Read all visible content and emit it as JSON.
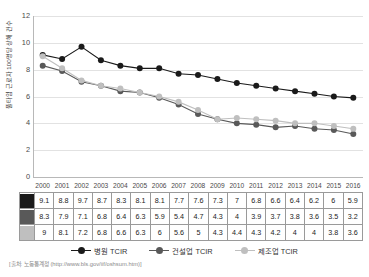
{
  "chart_data": {
    "type": "line",
    "title": "",
    "xlabel": "",
    "ylabel": "풀타임 근로자 100명당 상해 건수",
    "ylim": [
      0,
      12
    ],
    "yticks": [
      0,
      2,
      4,
      6,
      8,
      10,
      12
    ],
    "grid": true,
    "legend_position": "bottom",
    "categories": [
      "2000",
      "2001",
      "2002",
      "2003",
      "2004",
      "2005",
      "2006",
      "2007",
      "2008",
      "2009",
      "2010",
      "2011",
      "2012",
      "2013",
      "2014",
      "2015",
      "2016"
    ],
    "series": [
      {
        "name": "병원 TCIR",
        "color": "#1a1a1a",
        "values": [
          9.1,
          8.8,
          9.7,
          8.7,
          8.3,
          8.1,
          8.1,
          7.7,
          7.6,
          7.3,
          7,
          6.8,
          6.6,
          6.4,
          6.2,
          6,
          5.9
        ],
        "labels": [
          "9.1",
          "8.8",
          "9.7",
          "8.7",
          "8.3",
          "8.1",
          "8.1",
          "7.7",
          "7.6",
          "7.3",
          "7",
          "6.8",
          "6.6",
          "6.4",
          "6.2",
          "6",
          "5.9"
        ]
      },
      {
        "name": "건설업 TCIR",
        "color": "#595959",
        "values": [
          8.3,
          7.9,
          7.1,
          6.8,
          6.4,
          6.3,
          5.9,
          5.4,
          4.7,
          4.3,
          4,
          3.9,
          3.7,
          3.8,
          3.6,
          3.5,
          3.2
        ],
        "labels": [
          "8.3",
          "7.9",
          "7.1",
          "6.8",
          "6.4",
          "6.3",
          "5.9",
          "5.4",
          "4.7",
          "4.3",
          "4",
          "3.9",
          "3.7",
          "3.8",
          "3.6",
          "3.5",
          "3.2"
        ]
      },
      {
        "name": "제조업 TCIR",
        "color": "#bfbfbf",
        "values": [
          9,
          8.1,
          7.2,
          6.8,
          6.6,
          6.3,
          6,
          5.6,
          5,
          4.3,
          4.4,
          4.3,
          4.2,
          4,
          4,
          3.8,
          3.6
        ],
        "labels": [
          "9",
          "8.1",
          "7.2",
          "6.8",
          "6.6",
          "6.3",
          "6",
          "5.6",
          "5",
          "4.3",
          "4.4",
          "4.3",
          "4.2",
          "4",
          "4",
          "3.8",
          "3.6"
        ]
      }
    ]
  },
  "axis": {
    "ylabel": "풀타임 근로자 100명당 상해 건수",
    "yticks": [
      "12",
      "10",
      "8",
      "6",
      "4",
      "2",
      "0"
    ]
  },
  "years": [
    "2000",
    "2001",
    "2002",
    "2003",
    "2004",
    "2005",
    "2006",
    "2007",
    "2008",
    "2009",
    "2010",
    "2011",
    "2012",
    "2013",
    "2014",
    "2015",
    "2016"
  ],
  "legend": [
    {
      "label": "병원 TCIR",
      "color": "#1a1a1a"
    },
    {
      "label": "건설업 TCIR",
      "color": "#595959"
    },
    {
      "label": "제조업 TCIR",
      "color": "#bfbfbf"
    }
  ],
  "table": {
    "rows": [
      {
        "swatch": "#1a1a1a",
        "cells": [
          "9.1",
          "8.8",
          "9.7",
          "8.7",
          "8.3",
          "8.1",
          "8.1",
          "7.7",
          "7.6",
          "7.3",
          "7",
          "6.8",
          "6.6",
          "6.4",
          "6.2",
          "6",
          "5.9"
        ]
      },
      {
        "swatch": "#595959",
        "cells": [
          "8.3",
          "7.9",
          "7.1",
          "6.8",
          "6.4",
          "6.3",
          "5.9",
          "5.4",
          "4.7",
          "4.3",
          "4",
          "3.9",
          "3.7",
          "3.8",
          "3.6",
          "3.5",
          "3.2"
        ]
      },
      {
        "swatch": "#bfbfbf",
        "cells": [
          "9",
          "8.1",
          "7.2",
          "6.8",
          "6.6",
          "6.3",
          "6",
          "5.6",
          "5",
          "4.3",
          "4.4",
          "4.3",
          "4.2",
          "4",
          "4",
          "3.8",
          "3.6"
        ]
      }
    ]
  },
  "source": {
    "text": "[출처: 노동통계청 (http://www.bls.gov/iif/oshsum.htm)]"
  }
}
